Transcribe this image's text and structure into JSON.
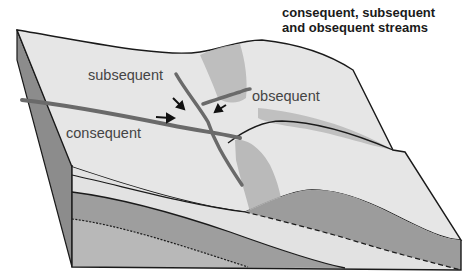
{
  "title": {
    "line1": "consequent, subsequent",
    "line2": "and obsequent streams"
  },
  "labels": {
    "subsequent": "subsequent",
    "obsequent": "obsequent",
    "consequent": "consequent"
  },
  "colors": {
    "surface": "#e4e4e4",
    "outline": "#1a1a1a",
    "stream": "#6a6a6a",
    "ridge_shade": "#b4b4b4",
    "layer_light": "#e0e0e0",
    "layer_dark": "#9c9c9c",
    "layer_mid": "#b8b8b8",
    "side_face": "#8a8a8a"
  }
}
